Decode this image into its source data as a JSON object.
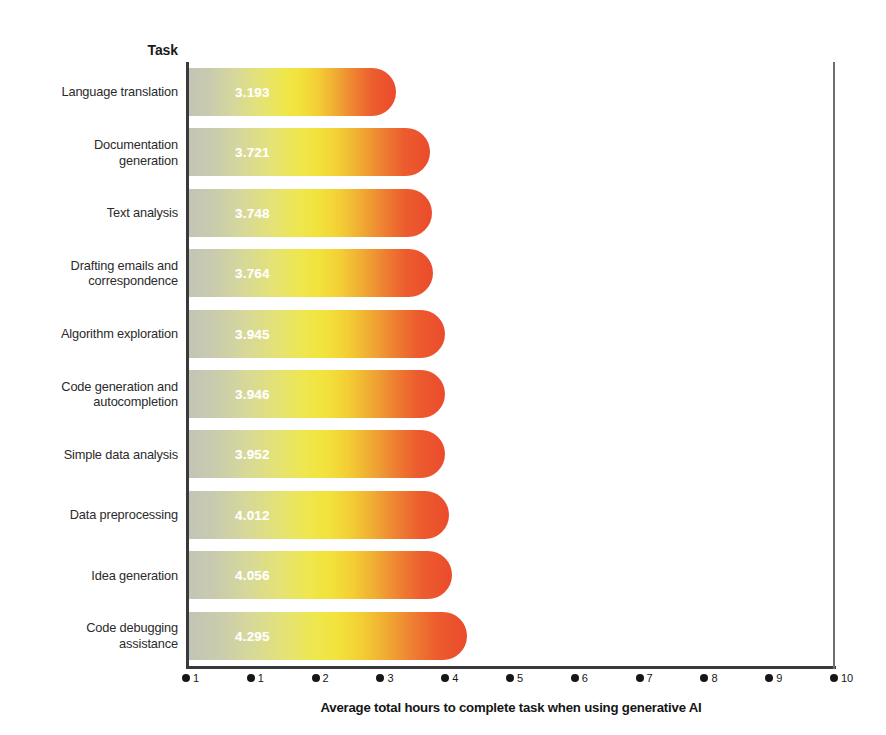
{
  "header": {
    "task_column_label": "Task"
  },
  "axis": {
    "x_title": "Average total hours to complete task when using generative AI",
    "x_tick_labels": [
      "1",
      "1",
      "2",
      "3",
      "4",
      "5",
      "6",
      "7",
      "8",
      "9",
      "10"
    ],
    "x_min": 0,
    "x_max": 10
  },
  "colors": {
    "gradient_start": "#c3c5b6",
    "gradient_mid": "#f2e33c",
    "gradient_end": "#eb4b2c",
    "axis_line": "#3a3a3c",
    "text": "#231f20",
    "value_label": "#ffffff"
  },
  "chart_data": {
    "type": "bar",
    "orientation": "horizontal",
    "title": "",
    "subtitle": "",
    "xlabel": "Average total hours to complete task when using generative AI",
    "ylabel": "Task",
    "xlim": [
      0,
      10
    ],
    "grid": false,
    "legend": null,
    "categories": [
      "Language translation",
      "Documentation\ngeneration",
      "Text analysis",
      "Drafting emails and\ncorrespondence",
      "Algorithm exploration",
      "Code generation and\nautocompletion",
      "Simple data analysis",
      "Data preprocessing",
      "Idea  generation",
      "Code debugging\nassistance"
    ],
    "values": [
      3.193,
      3.721,
      3.748,
      3.764,
      3.945,
      3.946,
      3.952,
      4.012,
      4.056,
      4.295
    ],
    "value_labels": [
      "3.193",
      "3.721",
      "3.748",
      "3.764",
      "3.945",
      "3.946",
      "3.952",
      "4.012",
      "4.056",
      "4.295"
    ]
  },
  "rows": [
    {
      "label": "Language translation",
      "value": 3.193,
      "value_label": "3.193"
    },
    {
      "label": "Documentation\ngeneration",
      "value": 3.721,
      "value_label": "3.721"
    },
    {
      "label": "Text analysis",
      "value": 3.748,
      "value_label": "3.748"
    },
    {
      "label": "Drafting emails and\ncorrespondence",
      "value": 3.764,
      "value_label": "3.764"
    },
    {
      "label": "Algorithm exploration",
      "value": 3.945,
      "value_label": "3.945"
    },
    {
      "label": "Code generation and\nautocompletion",
      "value": 3.946,
      "value_label": "3.946"
    },
    {
      "label": "Simple data analysis",
      "value": 3.952,
      "value_label": "3.952"
    },
    {
      "label": "Data preprocessing",
      "value": 4.012,
      "value_label": "4.012"
    },
    {
      "label": "Idea  generation",
      "value": 4.056,
      "value_label": "4.056"
    },
    {
      "label": "Code debugging\nassistance",
      "value": 4.295,
      "value_label": "4.295"
    }
  ]
}
